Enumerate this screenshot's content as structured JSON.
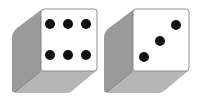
{
  "dice": [
    {
      "label": "die-six",
      "value": 6
    },
    {
      "label": "die-three",
      "value": 3
    }
  ],
  "colors": {
    "face": "#ffffff",
    "side": "#9a9a9a",
    "bottom": "#b4b4b4",
    "edge": "#555555",
    "pip": "#111111"
  }
}
